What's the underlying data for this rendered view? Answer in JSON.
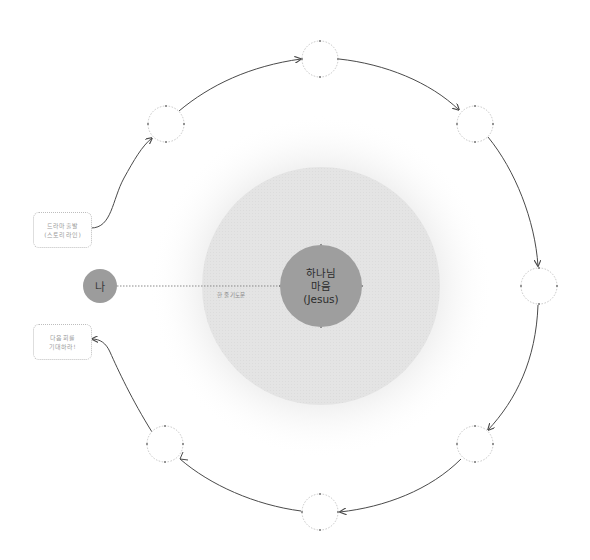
{
  "diagram": {
    "colors": {
      "background": "#ffffff",
      "halo": "#f3f3f3",
      "outer_disc": "#e3e3e3",
      "core_disc": "#9e9e9e",
      "me_disc": "#9c9c9c",
      "arrow": "#4a4a4a",
      "node_border": "#c6c6c6",
      "node_dot": "#777777"
    },
    "center": {
      "label_line1": "하나님",
      "label_line2": "마음",
      "label_line3": "(Jesus)"
    },
    "me": {
      "label": "나"
    },
    "connector": {
      "label": "한 줄 기도문"
    },
    "start_box": {
      "line1": "드라마 출발",
      "line2": "(스토리 라인)"
    },
    "end_box": {
      "line1": "다음 회를",
      "line2": "기대하라!"
    },
    "cycle_nodes": [
      {
        "id": "node-1",
        "x": 166,
        "y": 124
      },
      {
        "id": "node-2",
        "x": 320,
        "y": 59
      },
      {
        "id": "node-3",
        "x": 475,
        "y": 124
      },
      {
        "id": "node-4",
        "x": 539,
        "y": 286
      },
      {
        "id": "node-5",
        "x": 475,
        "y": 444
      },
      {
        "id": "node-6",
        "x": 320,
        "y": 512
      },
      {
        "id": "node-7",
        "x": 165,
        "y": 444
      }
    ]
  }
}
